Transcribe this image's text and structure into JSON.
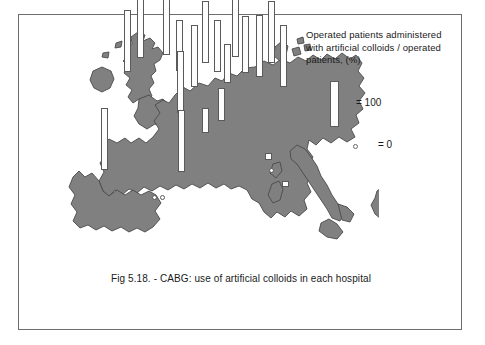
{
  "figure": {
    "caption": "Fig 5.18. - CABG: use of artificial colloids in each hospital",
    "frame_color": "#6e6e6e",
    "background": "#ffffff"
  },
  "legend": {
    "title": "Operated patients administered with artificial colloids / operated patients, (%)",
    "bar_label": "= 100",
    "dot_label": "=  0",
    "bar_symbol_name": "tall-white-bar",
    "dot_symbol_name": "small-circle",
    "bar_fill": "#fdfdfd",
    "bar_stroke": "#5a5a5a"
  },
  "map": {
    "land_color": "#808080",
    "land_stroke": "#4a4a4a",
    "sea_color": "#ffffff",
    "region": "Western and Southern Europe"
  },
  "chart_data": {
    "type": "bar",
    "title": "CABG: use of artificial colloids in each hospital",
    "ylabel": "Operated patients administered with artificial colloids / operated patients, (%)",
    "xlabel": "",
    "ylim": [
      0,
      100
    ],
    "grid": false,
    "legend_position": "top-right",
    "value_unit": "%",
    "note": "Each bar is a hospital plotted at its geographic location on a map of Europe. Bar height encodes percentage; a small open circle denotes 0%.",
    "markers": [
      {
        "id": "h01",
        "country": "United Kingdom",
        "x": 108,
        "y": 57,
        "value": 100,
        "shape": "bar"
      },
      {
        "id": "h02",
        "country": "United Kingdom",
        "x": 121,
        "y": 43,
        "value": 100,
        "shape": "bar"
      },
      {
        "id": "h03",
        "country": "United Kingdom",
        "x": 147,
        "y": 40,
        "value": 100,
        "shape": "bar"
      },
      {
        "id": "h04",
        "country": "United Kingdom",
        "x": 160,
        "y": 56,
        "value": 82,
        "shape": "bar"
      },
      {
        "id": "h05",
        "country": "Belgium",
        "x": 175,
        "y": 72,
        "value": 100,
        "shape": "bar"
      },
      {
        "id": "h06",
        "country": "Netherlands",
        "x": 186,
        "y": 48,
        "value": 100,
        "shape": "bar"
      },
      {
        "id": "h07",
        "country": "Germany",
        "x": 198,
        "y": 57,
        "value": 84,
        "shape": "bar"
      },
      {
        "id": "h08",
        "country": "Germany",
        "x": 208,
        "y": 68,
        "value": 63,
        "shape": "bar"
      },
      {
        "id": "h09",
        "country": "Germany",
        "x": 216,
        "y": 42,
        "value": 100,
        "shape": "bar"
      },
      {
        "id": "h10",
        "country": "Germany",
        "x": 226,
        "y": 58,
        "value": 92,
        "shape": "bar"
      },
      {
        "id": "h11",
        "country": "Germany",
        "x": 240,
        "y": 62,
        "value": 100,
        "shape": "bar"
      },
      {
        "id": "h12",
        "country": "Germany",
        "x": 252,
        "y": 48,
        "value": 100,
        "shape": "bar"
      },
      {
        "id": "h13",
        "country": "Austria",
        "x": 264,
        "y": 72,
        "value": 100,
        "shape": "bar"
      },
      {
        "id": "h14",
        "country": "France",
        "x": 161,
        "y": 98,
        "value": 100,
        "shape": "bar"
      },
      {
        "id": "h15",
        "country": "France",
        "x": 186,
        "y": 118,
        "value": 40,
        "shape": "bar"
      },
      {
        "id": "h16",
        "country": "Switzerland",
        "x": 202,
        "y": 106,
        "value": 54,
        "shape": "bar"
      },
      {
        "id": "h17",
        "country": "Portugal",
        "x": 85,
        "y": 155,
        "value": 100,
        "shape": "bar"
      },
      {
        "id": "h18",
        "country": "Spain",
        "x": 162,
        "y": 157,
        "value": 100,
        "shape": "bar"
      },
      {
        "id": "h19",
        "country": "Spain",
        "x": 135,
        "y": 182,
        "value": 0,
        "shape": "dot"
      },
      {
        "id": "h20",
        "country": "Spain",
        "x": 143,
        "y": 182,
        "value": 0,
        "shape": "dot"
      },
      {
        "id": "h21",
        "country": "Italy",
        "x": 252,
        "y": 155,
        "value": 0,
        "shape": "dot"
      },
      {
        "id": "h22",
        "country": "Italy",
        "x": 249,
        "y": 145,
        "value": 12,
        "shape": "bar"
      },
      {
        "id": "h23",
        "country": "Italy",
        "x": 266,
        "y": 172,
        "value": 10,
        "shape": "bar"
      }
    ]
  }
}
